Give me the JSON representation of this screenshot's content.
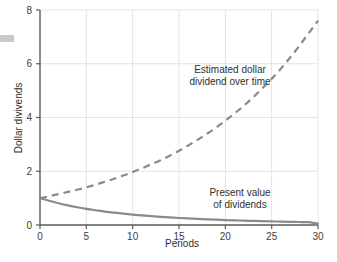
{
  "chart_data": {
    "type": "line",
    "title": "",
    "xlabel": "Periods",
    "ylabel": "Dollar divivends",
    "xlim": [
      0,
      30
    ],
    "ylim": [
      0,
      8
    ],
    "xticks": [
      "0",
      "5",
      "10",
      "15",
      "20",
      "25",
      "30"
    ],
    "xtick_values": [
      0,
      5,
      10,
      15,
      20,
      25,
      30
    ],
    "yticks": [
      "0",
      "2",
      "4",
      "6",
      "8"
    ],
    "ytick_values": [
      0,
      2,
      4,
      6,
      8
    ],
    "grid": "both-light-gray",
    "legend": "none-inline-annotations",
    "x": [
      0,
      1,
      2,
      3,
      4,
      5,
      6,
      7,
      8,
      9,
      10,
      11,
      12,
      13,
      14,
      15,
      16,
      17,
      18,
      19,
      20,
      21,
      22,
      23,
      24,
      25,
      26,
      27,
      28,
      29,
      30
    ],
    "series": [
      {
        "name": "Estimated dollar dividend over time",
        "style": "dashed",
        "color": "#8a8a8a",
        "values": [
          1.0,
          1.07,
          1.15,
          1.23,
          1.31,
          1.4,
          1.5,
          1.61,
          1.72,
          1.84,
          1.97,
          2.11,
          2.26,
          2.41,
          2.58,
          2.76,
          2.96,
          3.17,
          3.39,
          3.62,
          3.88,
          4.15,
          4.44,
          4.75,
          5.09,
          5.44,
          5.82,
          6.23,
          6.67,
          7.14,
          7.6
        ]
      },
      {
        "name": "Present value of dividends",
        "style": "solid",
        "color": "#8a8a8a",
        "values": [
          1.0,
          0.9,
          0.81,
          0.73,
          0.66,
          0.6,
          0.55,
          0.5,
          0.46,
          0.42,
          0.385,
          0.355,
          0.328,
          0.303,
          0.281,
          0.261,
          0.243,
          0.227,
          0.212,
          0.198,
          0.185,
          0.173,
          0.162,
          0.152,
          0.143,
          0.134,
          0.126,
          0.118,
          0.111,
          0.104,
          0.05
        ]
      }
    ],
    "annotations": [
      {
        "id": "estimated-dividend-annotation",
        "lines": [
          "Estimated dollar",
          "dividend over time"
        ],
        "x_px": 230,
        "y_px": 73
      },
      {
        "id": "present-value-annotation",
        "lines": [
          "Present value",
          "of dividends"
        ],
        "x_px": 240,
        "y_px": 196
      }
    ],
    "colors": {
      "axis": "#5a5a5a",
      "grid": "#e3e3e3",
      "curve": "#8a8a8a",
      "text": "#303030",
      "background": "#ffffff",
      "artifact": "#c9c9c9"
    }
  },
  "axes": {
    "y_title": "Dollar divivends",
    "x_title": "Periods"
  },
  "annotation_text": {
    "estimated_line1": "Estimated dollar",
    "estimated_line2": "dividend over time",
    "present_line1": "Present value",
    "present_line2": "of dividends"
  },
  "tick_text": {
    "y": [
      "8",
      "6",
      "4",
      "2",
      "0"
    ],
    "x": [
      "0",
      "5",
      "10",
      "15",
      "20",
      "25",
      "30"
    ]
  }
}
